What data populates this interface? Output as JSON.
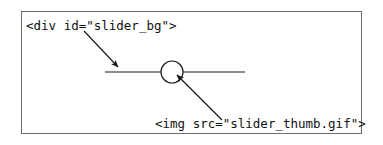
{
  "figure": {
    "background_color": "#ffffff",
    "frame": {
      "border_color": "#6d6d6d",
      "fill_color": "#ffffff"
    },
    "labels": {
      "slider_bg": "<div id=\"slider_bg\">",
      "slider_thumb": "<img src=\"slider_thumb.gif\">"
    },
    "graphic": {
      "track_color": "#1a1a1a",
      "thumb_stroke_color": "#1a1a1a",
      "thumb_fill_color": "#ffffff",
      "arrow_color": "#1a1a1a",
      "track": {
        "x1": 105,
        "y1": 72,
        "x2": 245,
        "y2": 72
      },
      "thumb": {
        "cx": 172,
        "cy": 72,
        "r": 11
      },
      "arrows": [
        {
          "name": "slider-bg-arrow",
          "x1": 84,
          "y1": 31,
          "x2": 120,
          "y2": 69
        },
        {
          "name": "slider-thumb-arrow",
          "x1": 222,
          "y1": 120,
          "x2": 175,
          "y2": 73
        }
      ]
    }
  }
}
